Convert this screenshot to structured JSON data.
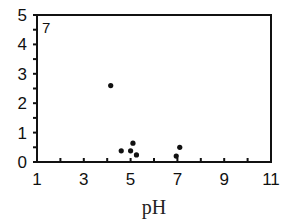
{
  "chart_data": {
    "type": "scatter",
    "title": "",
    "panel_label": "7",
    "xlabel": "pH",
    "ylabel": "",
    "xlim": [
      1,
      11
    ],
    "ylim": [
      0,
      5
    ],
    "x_ticks": [
      1,
      3,
      5,
      7,
      9,
      11
    ],
    "y_ticks": [
      0,
      1,
      2,
      3,
      4,
      5
    ],
    "grid": false,
    "legend": null,
    "series": [
      {
        "name": "data",
        "points": [
          {
            "x": 4.15,
            "y": 2.6
          },
          {
            "x": 4.6,
            "y": 0.38
          },
          {
            "x": 5.0,
            "y": 0.38
          },
          {
            "x": 5.1,
            "y": 0.64
          },
          {
            "x": 5.25,
            "y": 0.24
          },
          {
            "x": 6.95,
            "y": 0.2
          },
          {
            "x": 7.1,
            "y": 0.5
          }
        ]
      }
    ]
  }
}
